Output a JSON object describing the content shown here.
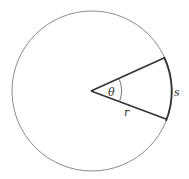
{
  "diagram": {
    "colors": {
      "background": "#ffffff",
      "circle_stroke": "#8a8a8a",
      "radius_stroke": "#333333",
      "arc_stroke": "#333333",
      "angle_arc_stroke": "#777777",
      "label": "#333333"
    },
    "geometry": {
      "center": [
        92,
        91
      ],
      "radius": 80,
      "sector_start_point": [
        164,
        60
      ],
      "sector_end_point": [
        166,
        118
      ],
      "angle_arc_radius": 30
    },
    "labels": {
      "theta": "θ",
      "radius": "r",
      "arc": "s"
    }
  }
}
